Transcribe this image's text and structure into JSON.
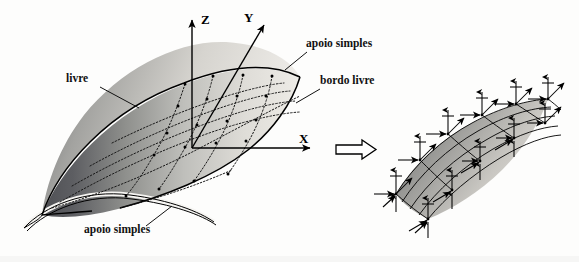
{
  "figure": {
    "title_visible": false,
    "language": "pt"
  },
  "axes": {
    "z_label": "Z",
    "y_label": "Y",
    "x_label": "X"
  },
  "labels": {
    "free_edge_left": "livre",
    "simple_support_top": "apoio simples",
    "free_edge_right": "bordo livre",
    "simple_support_bottom": "apoio simples"
  },
  "transition": {
    "symbol": "implication-arrow"
  },
  "left_shell": {
    "mesh_cols": 4,
    "mesh_rows": 4,
    "surface_shading": "dark-to-light gradient",
    "edge_style": "curved barrel vault"
  },
  "right_model": {
    "mesh_cols": 4,
    "mesh_rows": 4,
    "node_load_components": 3,
    "load_arrow_kinds": [
      "vertical",
      "horizontal",
      "diagonal"
    ]
  },
  "colors": {
    "background": "#fdfdfc",
    "ink": "#111111",
    "shell_dark": "#55565a",
    "shell_light": "#e8e7e3",
    "fem_dark": "#6d6e70",
    "fem_light": "#dcdbd7"
  }
}
